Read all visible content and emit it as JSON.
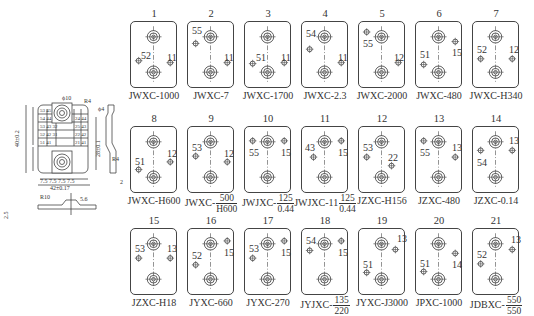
{
  "dimension_drawing": {
    "labels": {
      "height_total": "40±0.2",
      "height_holes": "28±0.1",
      "width_total": "42±0.17",
      "bottom_row": "7.5 7.5 7.5 7.5",
      "pitch_left": "6 6 6 6",
      "offset": "15",
      "hole_dia": "ϕ10",
      "r_corner": "R4",
      "pin_dia": "ϕ4",
      "side_r": "R4",
      "base_r": "R10",
      "base_w": "5.6",
      "base_h": "2.5",
      "base_h2": "6",
      "side_w": "2",
      "side_h": "3"
    },
    "pin_grid": [
      [
        "53",
        "45",
        "",
        "43"
      ],
      [
        "54",
        "44",
        "",
        "24",
        "44"
      ],
      [
        "53",
        "43",
        "32",
        "25",
        "43"
      ],
      [
        "52",
        "42",
        "31",
        "22",
        "42"
      ],
      [
        "51",
        "41",
        "",
        "21",
        "41"
      ]
    ]
  },
  "sockets": [
    {
      "num": "1",
      "model": "JWXC-1000",
      "pins": [
        {
          "l": "52",
          "x": 8,
          "y": 40,
          "lx": 10,
          "ly": 29
        },
        {
          "l": "11",
          "x": 41,
          "y": 42,
          "lx": 36,
          "ly": 31
        }
      ]
    },
    {
      "num": "2",
      "model": "JWXC-7",
      "pins": [
        {
          "l": "55",
          "x": 8,
          "y": 22,
          "lx": 4,
          "ly": 4
        },
        {
          "l": "11",
          "x": 41,
          "y": 42,
          "lx": 36,
          "ly": 31
        }
      ]
    },
    {
      "num": "3",
      "model": "JWXC-1700",
      "pins": [
        {
          "l": "51",
          "x": 8,
          "y": 43,
          "lx": 11,
          "ly": 31
        },
        {
          "l": "11",
          "x": 41,
          "y": 42,
          "lx": 36,
          "ly": 31
        }
      ]
    },
    {
      "num": "4",
      "model": "JWXC-2.3",
      "pins": [
        {
          "l": "54",
          "x": 8,
          "y": 28,
          "lx": 4,
          "ly": 7
        },
        {
          "l": "11",
          "x": 41,
          "y": 42,
          "lx": 36,
          "ly": 31
        }
      ]
    },
    {
      "num": "5",
      "model": "JWXC-2000",
      "pins": [
        {
          "l": "55",
          "x": 8,
          "y": 10,
          "lx": 4,
          "ly": 17
        },
        {
          "l": "12",
          "x": 41,
          "y": 42,
          "lx": 35,
          "ly": 31
        }
      ]
    },
    {
      "num": "6",
      "model": "JWXC-480",
      "pins": [
        {
          "l": "51",
          "x": 8,
          "y": 44,
          "lx": 4,
          "ly": 28
        },
        {
          "l": "15",
          "x": 41,
          "y": 20,
          "lx": 36,
          "ly": 26
        }
      ]
    },
    {
      "num": "7",
      "model": "JWXC-H340",
      "pins": [
        {
          "l": "52",
          "x": 8,
          "y": 38,
          "lx": 4,
          "ly": 23
        },
        {
          "l": "12",
          "x": 41,
          "y": 38,
          "lx": 36,
          "ly": 23
        }
      ]
    },
    {
      "num": "8",
      "model": "JWXC-H600",
      "pins": [
        {
          "l": "51",
          "x": 8,
          "y": 44,
          "lx": 4,
          "ly": 30
        },
        {
          "l": "12",
          "x": 41,
          "y": 36,
          "lx": 36,
          "ly": 22
        }
      ]
    },
    {
      "num": "9",
      "model": "JWXC-",
      "frac": [
        "500",
        "H600"
      ],
      "pins": [
        {
          "l": "53",
          "x": 8,
          "y": 30,
          "lx": 4,
          "ly": 16
        },
        {
          "l": "12",
          "x": 41,
          "y": 36,
          "lx": 36,
          "ly": 22
        }
      ]
    },
    {
      "num": "10",
      "model": "JWJXC-",
      "frac": [
        "125",
        "0.44"
      ],
      "pins": [
        {
          "l": "55",
          "x": 8,
          "y": 14,
          "lx": 4,
          "ly": 21
        },
        {
          "l": "15",
          "x": 41,
          "y": 14,
          "lx": 36,
          "ly": 21
        }
      ]
    },
    {
      "num": "11",
      "model": "JWJXC-11",
      "frac": [
        "125",
        "0.44"
      ],
      "pins": [
        {
          "l": "43",
          "x": 12,
          "y": 31,
          "lx": 3,
          "ly": 16
        },
        {
          "l": "15",
          "x": 41,
          "y": 14,
          "lx": 36,
          "ly": 21
        }
      ]
    },
    {
      "num": "12",
      "model": "JZXC-H156",
      "pins": [
        {
          "l": "53",
          "x": 8,
          "y": 31,
          "lx": 4,
          "ly": 16
        },
        {
          "l": "22",
          "x": 34,
          "y": 40,
          "lx": 29,
          "ly": 26
        }
      ]
    },
    {
      "num": "13",
      "model": "JZXC-480",
      "pins": [
        {
          "l": "55",
          "x": 8,
          "y": 14,
          "lx": 4,
          "ly": 21
        },
        {
          "l": "13",
          "x": 41,
          "y": 31,
          "lx": 36,
          "ly": 16
        }
      ]
    },
    {
      "num": "14",
      "model": "JZXC-0.14",
      "pins": [
        {
          "l": "54",
          "x": 8,
          "y": 24,
          "lx": 4,
          "ly": 31
        },
        {
          "l": "13",
          "x": 41,
          "y": 24,
          "lx": 36,
          "ly": 9
        }
      ]
    },
    {
      "num": "15",
      "model": "JZXC-H18",
      "pins": [
        {
          "l": "53",
          "x": 8,
          "y": 30,
          "lx": 4,
          "ly": 15
        },
        {
          "l": "13",
          "x": 41,
          "y": 30,
          "lx": 36,
          "ly": 15
        }
      ]
    },
    {
      "num": "16",
      "model": "JYXC-660",
      "pins": [
        {
          "l": "52",
          "x": 8,
          "y": 37,
          "lx": 4,
          "ly": 22
        },
        {
          "l": "15",
          "x": 41,
          "y": 12,
          "lx": 36,
          "ly": 19
        }
      ]
    },
    {
      "num": "17",
      "model": "JYXC-270",
      "pins": [
        {
          "l": "53",
          "x": 8,
          "y": 30,
          "lx": 4,
          "ly": 15
        },
        {
          "l": "15",
          "x": 41,
          "y": 12,
          "lx": 36,
          "ly": 19
        }
      ]
    },
    {
      "num": "18",
      "model": "JYJXC-",
      "frac": [
        "135",
        "220"
      ],
      "pins": [
        {
          "l": "54",
          "x": 8,
          "y": 22,
          "lx": 4,
          "ly": 7
        },
        {
          "l": "15",
          "x": 41,
          "y": 12,
          "lx": 36,
          "ly": 19
        }
      ]
    },
    {
      "num": "19",
      "model": "JYXC-J3000",
      "pins": [
        {
          "l": "51",
          "x": 8,
          "y": 45,
          "lx": 4,
          "ly": 31
        },
        {
          "l": "13",
          "x": 38,
          "y": 21,
          "lx": 38,
          "ly": 5
        }
      ]
    },
    {
      "num": "20",
      "model": "JPXC-1000",
      "pins": [
        {
          "l": "51",
          "x": 8,
          "y": 44,
          "lx": 4,
          "ly": 30
        },
        {
          "l": "14",
          "x": 41,
          "y": 25,
          "lx": 36,
          "ly": 31
        }
      ]
    },
    {
      "num": "21",
      "model": "JDBXC-",
      "frac": [
        "550",
        "550"
      ],
      "pins": [
        {
          "l": "52",
          "x": 8,
          "y": 36,
          "lx": 4,
          "ly": 21
        },
        {
          "l": "13",
          "x": 41,
          "y": 21,
          "lx": 38,
          "ly": 6
        }
      ]
    }
  ]
}
